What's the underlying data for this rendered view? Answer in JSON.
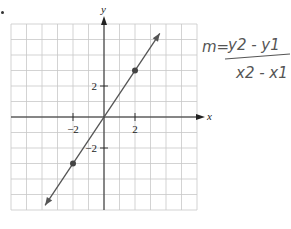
{
  "figure": {
    "type": "coordinate-graph",
    "axes": {
      "x_label": "x",
      "y_label": "y",
      "x_ticks": [
        {
          "value": -2,
          "label": "−2"
        },
        {
          "value": 2,
          "label": "2"
        }
      ],
      "y_ticks": [
        {
          "value": 2,
          "label": "2"
        },
        {
          "value": -2,
          "label": "−2"
        }
      ],
      "x_range": [
        -6,
        6
      ],
      "y_range": [
        -6,
        6
      ],
      "grid": true
    },
    "line": {
      "description": "line through origin with arrows at both ends",
      "points": [
        {
          "x": -2,
          "y": -3
        },
        {
          "x": 2,
          "y": 3
        }
      ],
      "slope": 1.5
    },
    "colors": {
      "grid": "#c8c8c8",
      "axis": "#222222",
      "line": "#555555",
      "point": "#444444"
    }
  },
  "annotation": {
    "lhs": "m=",
    "numerator": "y2 - y1",
    "denominator": "x2 - x1"
  },
  "chart_data": {
    "type": "line",
    "title": "",
    "xlabel": "x",
    "ylabel": "y",
    "xlim": [
      -6,
      6
    ],
    "ylim": [
      -6,
      6
    ],
    "grid": true,
    "x_ticks": [
      -2,
      2
    ],
    "y_ticks": [
      -2,
      2
    ],
    "series": [
      {
        "name": "line",
        "x": [
          -2,
          0,
          2
        ],
        "y": [
          -3,
          0,
          3
        ]
      }
    ],
    "marked_points": [
      {
        "x": -2,
        "y": -3
      },
      {
        "x": 2,
        "y": 3
      }
    ],
    "annotations": [
      "m = (y2 - y1) / (x2 - x1)"
    ]
  }
}
